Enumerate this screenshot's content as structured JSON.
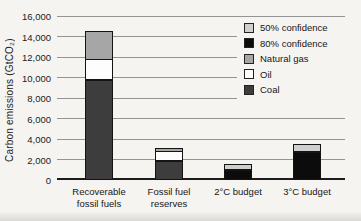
{
  "page": {
    "background": "#f5f4f1"
  },
  "chart_data": {
    "type": "bar",
    "stacked": true,
    "title": "",
    "xlabel": "",
    "ylabel": "Carbon emissions (GtCO₂)",
    "ylim": [
      0,
      16000
    ],
    "ytick_interval": 2000,
    "yticks": [
      "0",
      "2,000",
      "4,000",
      "6,000",
      "8,000",
      "10,000",
      "12,000",
      "14,000",
      "16,000"
    ],
    "grid": true,
    "categories": [
      "Recoverable fossil fuels",
      "Fossil fuel reserves",
      "2°C budget",
      "3°C budget"
    ],
    "categories_display": [
      [
        "Recoverable",
        "fossil fuels"
      ],
      [
        "Fossil fuel",
        "reserves"
      ],
      [
        "2°C budget"
      ],
      [
        "3°C budget"
      ]
    ],
    "series": [
      {
        "name": "Coal",
        "color": "#3d3d3d",
        "values": [
          9800,
          1850,
          0,
          0
        ]
      },
      {
        "name": "Oil",
        "color": "#fdfdfd",
        "values": [
          1900,
          850,
          0,
          0
        ]
      },
      {
        "name": "Natural gas",
        "color": "#a6a6a6",
        "values": [
          2700,
          300,
          0,
          0
        ]
      },
      {
        "name": "80% confidence",
        "color": "#0c0c0c",
        "values": [
          0,
          0,
          1000,
          2700
        ]
      },
      {
        "name": "50% confidence",
        "color": "#cfcfcf",
        "values": [
          0,
          0,
          500,
          700
        ]
      }
    ],
    "bar_totals": [
      14400,
      3000,
      1500,
      3400
    ],
    "legend": {
      "position": "upper-right",
      "entries": [
        {
          "label": "50% confidence",
          "color": "#cfcfcf"
        },
        {
          "label": "80% confidence",
          "color": "#0c0c0c"
        },
        {
          "label": "Natural gas",
          "color": "#a6a6a6"
        },
        {
          "label": "Oil",
          "color": "#fdfdfd"
        },
        {
          "label": "Coal",
          "color": "#3d3d3d"
        }
      ]
    },
    "colors": {
      "gridline": "#949494",
      "axis_baseline": "#1c1c1c",
      "segment_border": "#141414",
      "text": "#1b1b1b"
    }
  }
}
